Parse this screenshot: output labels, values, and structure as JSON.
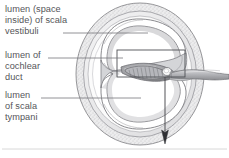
{
  "figure": {
    "kind": "anatomical-cross-section",
    "background_color": "#ffffff",
    "text_color": "#555559",
    "line_color": "#6b6b70",
    "bone_fill": "#e9e9ea",
    "bone_stipple": "#a9a9ad",
    "duct_fill": "#8f9094",
    "lumen_fill": "#ffffff",
    "rule_color": "#d8d8d8"
  },
  "labels": {
    "scala_vestibuli": "lumen (space\ninside) of scala\nvestibuli",
    "cochlear_duct": "lumen of\ncochlear\nduct",
    "scala_tympani": "lumen\nof scala\ntympani"
  },
  "leaders": [
    {
      "name": "leader-scala-vestibuli",
      "x1": 63,
      "y1": 33,
      "x2": 148,
      "y2": 33
    },
    {
      "name": "leader-cochlear-duct",
      "x1": 48,
      "y1": 58,
      "x2": 123,
      "y2": 58
    },
    {
      "name": "leader-scala-tympani",
      "x1": 41,
      "y1": 98,
      "x2": 141,
      "y2": 98
    }
  ],
  "callout_box": {
    "name": "organ-of-corti-detail-box",
    "x": 117,
    "y": 50,
    "width": 68,
    "height": 27
  },
  "pointer_arrow": {
    "name": "section-direction-arrow",
    "x": 165,
    "y_top": 77,
    "y_tip": 144
  },
  "footer_rule": {
    "name": "footer-divider",
    "y": 149
  }
}
